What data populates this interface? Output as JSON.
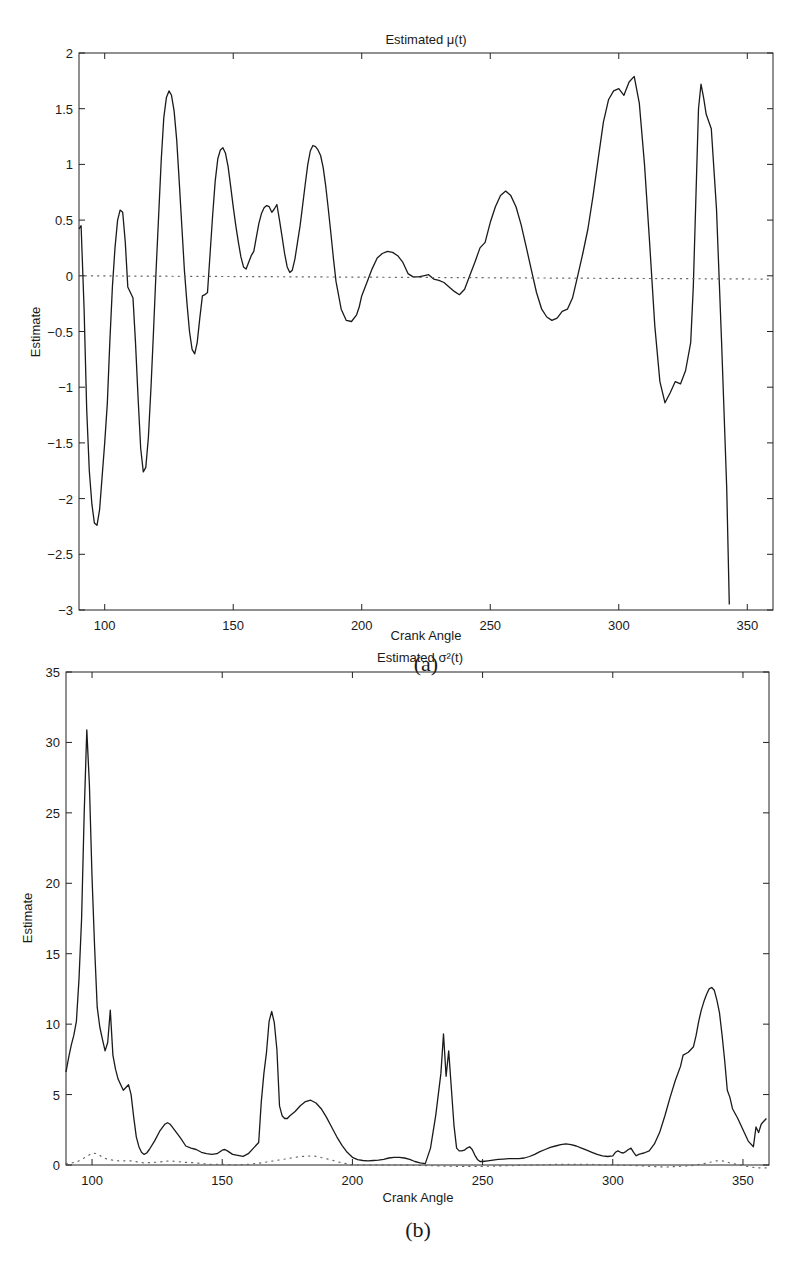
{
  "figure": {
    "panels": [
      {
        "caption": "(a)"
      },
      {
        "caption": "(b)"
      }
    ]
  },
  "chart_data": [
    {
      "type": "line",
      "panel": "(a)",
      "title": "Estimated μ(t)",
      "xlabel": "Crank Angle",
      "ylabel": "Estimate",
      "xlim": [
        90,
        360
      ],
      "ylim": [
        -3,
        2
      ],
      "xticks": [
        100,
        150,
        200,
        250,
        300,
        350
      ],
      "yticks": [
        -3,
        -2.5,
        -2,
        -1.5,
        -1,
        -0.5,
        0,
        0.5,
        1,
        1.5,
        2
      ],
      "ytick_labels": [
        "−3",
        "−2.5",
        "−2",
        "−1.5",
        "−1",
        "−0.5",
        "0",
        "0.5",
        "1",
        "1.5",
        "2"
      ],
      "grid": false,
      "legend": null,
      "series": [
        {
          "name": "estimate",
          "style": "solid",
          "x": [
            90,
            90.8,
            92,
            93,
            94,
            95,
            96,
            97,
            98,
            100,
            101,
            102,
            103,
            104,
            105,
            106,
            107,
            108,
            109,
            110,
            111,
            112,
            113,
            114,
            115,
            116,
            117,
            118,
            119,
            120,
            121,
            122,
            123,
            124,
            125,
            126,
            127,
            128,
            129,
            130,
            131,
            132,
            133,
            134,
            135,
            136,
            137,
            138,
            139,
            140,
            141,
            142,
            143,
            144,
            145,
            146,
            147,
            148,
            149,
            150,
            151,
            152,
            153,
            154,
            155,
            156,
            157,
            158,
            159,
            160,
            161,
            162,
            163,
            164,
            165,
            166,
            167,
            168,
            169,
            170,
            171,
            172,
            173,
            174,
            175,
            176,
            177,
            178,
            179,
            180,
            181,
            182,
            183,
            184,
            185,
            186,
            187,
            188,
            189,
            190,
            192,
            194,
            196,
            198,
            199,
            200,
            202,
            204,
            206,
            208,
            210,
            212,
            214,
            216,
            218,
            220,
            222,
            224,
            226,
            228,
            230,
            232,
            234,
            236,
            238,
            240,
            242,
            244,
            246,
            248,
            250,
            252,
            254,
            256,
            258,
            260,
            262,
            264,
            266,
            268,
            270,
            272,
            274,
            276,
            278,
            280,
            282,
            284,
            286,
            288,
            290,
            292,
            294,
            296,
            298,
            300,
            302,
            304,
            306,
            308,
            310,
            312,
            314,
            316,
            318,
            320,
            322,
            324,
            326,
            328,
            329,
            330,
            331,
            332,
            333,
            334,
            336,
            338,
            340,
            342,
            343,
            344,
            345,
            346,
            347,
            348,
            350,
            352,
            353,
            354,
            355,
            356,
            357,
            358,
            359,
            360
          ],
          "y": [
            0.42,
            0.45,
            -0.3,
            -1.2,
            -1.75,
            -2.05,
            -2.22,
            -2.24,
            -2.1,
            -1.5,
            -1.15,
            -0.6,
            -0.1,
            0.25,
            0.5,
            0.59,
            0.57,
            0.3,
            -0.1,
            -0.15,
            -0.2,
            -0.6,
            -1.1,
            -1.55,
            -1.76,
            -1.72,
            -1.45,
            -1.0,
            -0.5,
            0.05,
            0.55,
            1.05,
            1.42,
            1.6,
            1.66,
            1.62,
            1.48,
            1.22,
            0.85,
            0.45,
            0.05,
            -0.25,
            -0.5,
            -0.66,
            -0.7,
            -0.6,
            -0.38,
            -0.18,
            -0.17,
            -0.15,
            0.2,
            0.55,
            0.85,
            1.05,
            1.13,
            1.15,
            1.1,
            0.98,
            0.8,
            0.62,
            0.45,
            0.3,
            0.17,
            0.08,
            0.06,
            0.12,
            0.18,
            0.22,
            0.35,
            0.47,
            0.56,
            0.61,
            0.63,
            0.62,
            0.57,
            0.6,
            0.64,
            0.5,
            0.35,
            0.2,
            0.08,
            0.03,
            0.05,
            0.15,
            0.3,
            0.45,
            0.63,
            0.82,
            1.0,
            1.12,
            1.17,
            1.16,
            1.13,
            1.08,
            0.97,
            0.8,
            0.6,
            0.38,
            0.15,
            -0.05,
            -0.3,
            -0.4,
            -0.41,
            -0.35,
            -0.28,
            -0.18,
            -0.06,
            0.06,
            0.16,
            0.2,
            0.22,
            0.21,
            0.18,
            0.12,
            0.02,
            -0.01,
            -0.01,
            0.0,
            0.01,
            -0.03,
            -0.04,
            -0.06,
            -0.1,
            -0.14,
            -0.17,
            -0.12,
            0.0,
            0.12,
            0.25,
            0.3,
            0.48,
            0.62,
            0.72,
            0.76,
            0.72,
            0.62,
            0.46,
            0.26,
            0.05,
            -0.15,
            -0.3,
            -0.37,
            -0.4,
            -0.38,
            -0.32,
            -0.3,
            -0.2,
            0.0,
            0.2,
            0.42,
            0.72,
            1.05,
            1.38,
            1.58,
            1.66,
            1.68,
            1.62,
            1.74,
            1.79,
            1.55,
            1.0,
            0.3,
            -0.45,
            -0.95,
            -1.14,
            -1.05,
            -0.95,
            -0.97,
            -0.85,
            -0.6,
            -0.1,
            0.7,
            1.5,
            1.72,
            1.6,
            1.45,
            1.32,
            0.6,
            -0.6,
            -1.9,
            -2.95
          ],
          "color": "#1a1a1a"
        },
        {
          "name": "zero reference",
          "style": "dotted",
          "x": [
            90,
            360
          ],
          "y": [
            0,
            -0.03
          ],
          "color": "#666666"
        }
      ]
    },
    {
      "type": "line",
      "panel": "(b)",
      "title": "Estimated σ²(t)",
      "xlabel": "Crank Angle",
      "ylabel": "Estimate",
      "xlim": [
        90,
        360
      ],
      "ylim": [
        0,
        35
      ],
      "xticks": [
        100,
        150,
        200,
        250,
        300,
        350
      ],
      "yticks": [
        0,
        5,
        10,
        15,
        20,
        25,
        30,
        35
      ],
      "ytick_labels": [
        "0",
        "5",
        "10",
        "15",
        "20",
        "25",
        "30",
        "35"
      ],
      "grid": false,
      "legend": null,
      "series": [
        {
          "name": "estimate",
          "style": "solid",
          "x": [
            90,
            91,
            92,
            93,
            94,
            95,
            96,
            97,
            98,
            99,
            100,
            101,
            102,
            103,
            104,
            105,
            106,
            107,
            108,
            109,
            110,
            111,
            112,
            113,
            114,
            115,
            116,
            117,
            118,
            119,
            120,
            121,
            122,
            124,
            126,
            128,
            129,
            130,
            132,
            134,
            136,
            138,
            140,
            142,
            144,
            146,
            148,
            150,
            151,
            152,
            154,
            156,
            158,
            160,
            162,
            164,
            165,
            166,
            167,
            168,
            169,
            170,
            171,
            172,
            173,
            174,
            175,
            176,
            178,
            180,
            182,
            184,
            186,
            188,
            190,
            192,
            194,
            196,
            198,
            200,
            202,
            204,
            206,
            208,
            210,
            212,
            214,
            216,
            218,
            220,
            222,
            224,
            226,
            228,
            230,
            232,
            234,
            235,
            236,
            237,
            238,
            239,
            240,
            241,
            242,
            243,
            244,
            245,
            246,
            247,
            248,
            249,
            250,
            252,
            254,
            256,
            258,
            260,
            262,
            264,
            266,
            268,
            270,
            272,
            274,
            276,
            278,
            280,
            282,
            284,
            286,
            288,
            290,
            292,
            294,
            296,
            298,
            300,
            301,
            302,
            303,
            304,
            305,
            306,
            307,
            308,
            309,
            310,
            311,
            312,
            314,
            316,
            318,
            320,
            322,
            324,
            326,
            327,
            328,
            329,
            330,
            331,
            332,
            333,
            334,
            335,
            336,
            337,
            338,
            339,
            340,
            341,
            342,
            343,
            344,
            345,
            346,
            348,
            350,
            352,
            354,
            355,
            356,
            357,
            358,
            359,
            360
          ],
          "y": [
            6.6,
            7.6,
            8.5,
            9.2,
            10.2,
            13.2,
            17.5,
            25.0,
            30.9,
            27.0,
            20.5,
            15.5,
            11.2,
            9.8,
            8.9,
            8.1,
            8.7,
            11.0,
            7.8,
            6.8,
            6.1,
            5.7,
            5.3,
            5.5,
            5.7,
            5.0,
            3.4,
            2.0,
            1.3,
            0.9,
            0.75,
            0.85,
            1.1,
            1.7,
            2.4,
            2.9,
            3.0,
            2.9,
            2.4,
            1.9,
            1.35,
            1.2,
            1.1,
            0.9,
            0.8,
            0.75,
            0.8,
            1.05,
            1.1,
            1.0,
            0.75,
            0.68,
            0.62,
            0.8,
            1.2,
            1.6,
            4.5,
            6.5,
            8.0,
            10.2,
            10.9,
            10.1,
            8.2,
            4.2,
            3.5,
            3.3,
            3.3,
            3.5,
            3.8,
            4.2,
            4.5,
            4.6,
            4.4,
            4.0,
            3.4,
            2.7,
            2.0,
            1.4,
            0.9,
            0.55,
            0.38,
            0.32,
            0.3,
            0.32,
            0.35,
            0.4,
            0.5,
            0.55,
            0.55,
            0.5,
            0.4,
            0.25,
            0.15,
            0.1,
            1.2,
            3.5,
            6.5,
            9.3,
            6.3,
            8.1,
            5.5,
            2.8,
            1.2,
            1.0,
            1.0,
            1.05,
            1.2,
            1.3,
            1.1,
            0.7,
            0.4,
            0.25,
            0.25,
            0.3,
            0.35,
            0.4,
            0.42,
            0.45,
            0.45,
            0.45,
            0.5,
            0.6,
            0.75,
            0.95,
            1.1,
            1.25,
            1.35,
            1.45,
            1.5,
            1.45,
            1.35,
            1.2,
            1.05,
            0.9,
            0.75,
            0.65,
            0.6,
            0.65,
            0.9,
            1.0,
            0.9,
            0.85,
            0.95,
            1.1,
            1.2,
            0.9,
            0.65,
            0.75,
            0.8,
            0.85,
            1.0,
            1.5,
            2.3,
            3.5,
            4.8,
            6.0,
            7.0,
            7.8,
            7.9,
            8.0,
            8.2,
            8.4,
            9.2,
            10.2,
            11.0,
            11.6,
            12.1,
            12.5,
            12.6,
            12.4,
            11.7,
            10.8,
            9.2,
            7.4,
            5.3,
            4.8,
            4.0,
            3.3,
            2.5,
            1.7,
            1.3,
            2.7,
            2.3,
            2.9,
            3.1,
            3.3
          ],
          "color": "#1a1a1a"
        },
        {
          "name": "reference",
          "style": "dotted",
          "x": [
            90,
            94,
            98,
            100,
            102,
            104,
            106,
            110,
            115,
            120,
            125,
            130,
            135,
            140,
            145,
            150,
            155,
            160,
            165,
            170,
            175,
            180,
            185,
            190,
            195,
            200,
            210,
            220,
            230,
            240,
            250,
            260,
            270,
            280,
            290,
            300,
            310,
            320,
            330,
            335,
            340,
            342,
            345,
            350,
            355,
            360
          ],
          "y": [
            0.1,
            0.2,
            0.6,
            0.85,
            0.8,
            0.55,
            0.4,
            0.3,
            0.3,
            0.15,
            0.2,
            0.3,
            0.2,
            0.15,
            0.05,
            0.05,
            0.0,
            0.05,
            0.15,
            0.3,
            0.45,
            0.6,
            0.65,
            0.45,
            0.2,
            0.0,
            0.0,
            0.0,
            -0.05,
            -0.1,
            -0.1,
            -0.05,
            0.0,
            0.05,
            0.05,
            0.0,
            -0.05,
            -0.15,
            -0.05,
            0.1,
            0.3,
            0.3,
            0.15,
            -0.05,
            -0.2,
            -0.2
          ],
          "color": "#666666"
        }
      ]
    }
  ]
}
